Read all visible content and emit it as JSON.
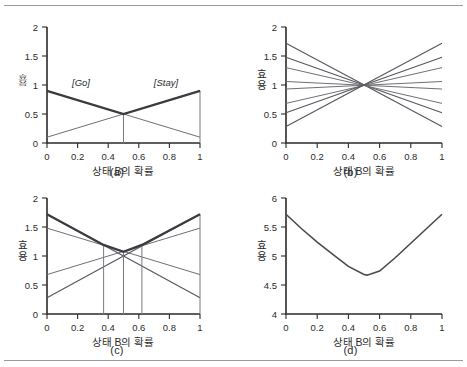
{
  "figure": {
    "panels": [
      {
        "id": "a",
        "caption": "(a)",
        "xlabel": "상태 B의 확률",
        "ylabel": "효용",
        "xticks": [
          "0",
          "0.2",
          "0.4",
          "0.6",
          "0.8",
          "1"
        ],
        "yticks": [
          "0",
          "0.5",
          "1",
          "1.5",
          "2"
        ],
        "annotations": [
          "[Go]",
          "[Stay]"
        ]
      },
      {
        "id": "b",
        "caption": "(b)",
        "xlabel": "상태 B의 확률",
        "ylabel": "효용",
        "xticks": [
          "0",
          "0.2",
          "0.4",
          "0.6",
          "0.8",
          "1"
        ],
        "yticks": [
          "0",
          "0.5",
          "1",
          "1.5",
          "2"
        ],
        "annotations": []
      },
      {
        "id": "c",
        "caption": "(c)",
        "xlabel": "상태 B의 확률",
        "ylabel": "효용",
        "xticks": [
          "0",
          "0.2",
          "0.4",
          "0.6",
          "0.8",
          "1"
        ],
        "yticks": [
          "0",
          "0.5",
          "1",
          "1.5",
          "2"
        ],
        "annotations": []
      },
      {
        "id": "d",
        "caption": "(d)",
        "xlabel": "상태 B의 확률",
        "ylabel": "효용",
        "xticks": [
          "0",
          "0.2",
          "0.4",
          "0.6",
          "0.8",
          "1"
        ],
        "yticks": [
          "4",
          "4.5",
          "5",
          "5.5",
          "6"
        ],
        "annotations": []
      }
    ]
  },
  "chart_data": [
    {
      "type": "line",
      "panel": "a",
      "title": "",
      "xlabel": "상태 B의 확률",
      "ylabel": "효용",
      "xlim": [
        0,
        1
      ],
      "ylim": [
        0,
        2
      ],
      "xticks": [
        0,
        0.2,
        0.4,
        0.6,
        0.8,
        1
      ],
      "yticks": [
        0,
        0.5,
        1,
        1.5,
        2
      ],
      "grid": false,
      "legend": "none",
      "x": [
        0,
        1
      ],
      "series": [
        {
          "name": "Go",
          "values": [
            0.9,
            0.1
          ],
          "style": "thin"
        },
        {
          "name": "Stay",
          "values": [
            0.1,
            0.9
          ],
          "style": "thin"
        }
      ],
      "envelope": {
        "name": "upper envelope",
        "x": [
          0,
          0.5,
          1
        ],
        "values": [
          0.9,
          0.5,
          0.9
        ]
      },
      "crossing": {
        "x": 0.5,
        "y": 0.5
      },
      "vlines": [
        0.5
      ],
      "annotations": [
        {
          "text": "[Go]",
          "x": 0.22,
          "y": 1.0
        },
        {
          "text": "[Stay]",
          "x": 0.74,
          "y": 1.0
        }
      ]
    },
    {
      "type": "line",
      "panel": "b",
      "title": "",
      "xlabel": "상태 B의 확률",
      "ylabel": "효용",
      "xlim": [
        0,
        1
      ],
      "ylim": [
        0,
        2
      ],
      "xticks": [
        0,
        0.2,
        0.4,
        0.6,
        0.8,
        1
      ],
      "yticks": [
        0,
        0.5,
        1,
        1.5,
        2
      ],
      "grid": false,
      "legend": "none",
      "x": [
        0,
        1
      ],
      "series": [
        {
          "name": "line-1",
          "values": [
            1.72,
            0.28
          ],
          "style": "mid"
        },
        {
          "name": "line-2",
          "values": [
            1.48,
            0.52
          ],
          "style": "mid"
        },
        {
          "name": "line-3",
          "values": [
            1.3,
            0.68
          ],
          "style": "thin"
        },
        {
          "name": "line-4",
          "values": [
            1.06,
            0.93
          ],
          "style": "thin"
        },
        {
          "name": "line-5",
          "values": [
            0.93,
            1.06
          ],
          "style": "thin"
        },
        {
          "name": "line-6",
          "values": [
            0.68,
            1.3
          ],
          "style": "thin"
        },
        {
          "name": "line-7",
          "values": [
            0.52,
            1.48
          ],
          "style": "mid"
        },
        {
          "name": "line-8",
          "values": [
            0.28,
            1.72
          ],
          "style": "mid"
        }
      ],
      "crossing": {
        "x": 0.5,
        "y": 1.0
      }
    },
    {
      "type": "line",
      "panel": "c",
      "title": "",
      "xlabel": "상태 B의 확률",
      "ylabel": "효용",
      "xlim": [
        0,
        1
      ],
      "ylim": [
        0,
        2
      ],
      "xticks": [
        0,
        0.2,
        0.4,
        0.6,
        0.8,
        1
      ],
      "yticks": [
        0,
        0.5,
        1,
        1.5,
        2
      ],
      "grid": false,
      "legend": "none",
      "x": [
        0,
        1
      ],
      "series": [
        {
          "name": "line-1",
          "values": [
            1.72,
            0.28
          ],
          "style": "mid"
        },
        {
          "name": "line-2",
          "values": [
            1.48,
            0.68
          ],
          "style": "thin"
        },
        {
          "name": "line-3",
          "values": [
            0.68,
            1.48
          ],
          "style": "thin"
        },
        {
          "name": "line-4",
          "values": [
            0.28,
            1.72
          ],
          "style": "mid"
        }
      ],
      "envelope": {
        "name": "upper envelope",
        "x": [
          0,
          0.37,
          0.5,
          0.62,
          1
        ],
        "values": [
          1.72,
          1.19,
          1.07,
          1.19,
          1.72
        ]
      },
      "vlines": [
        0.37,
        0.5,
        0.62
      ]
    },
    {
      "type": "line",
      "panel": "d",
      "title": "",
      "xlabel": "상태 B의 확률",
      "ylabel": "효용",
      "xlim": [
        0,
        1
      ],
      "ylim": [
        4,
        6
      ],
      "xticks": [
        0,
        0.2,
        0.4,
        0.6,
        0.8,
        1
      ],
      "yticks": [
        4,
        4.5,
        5,
        5.5,
        6
      ],
      "grid": false,
      "legend": "none",
      "x": [
        0,
        0.1,
        0.2,
        0.3,
        0.4,
        0.5,
        0.52,
        0.6,
        0.7,
        0.8,
        0.9,
        1
      ],
      "series": [
        {
          "name": "expected utility",
          "values": [
            5.72,
            5.47,
            5.24,
            5.03,
            4.82,
            4.68,
            4.67,
            4.74,
            4.97,
            5.22,
            5.47,
            5.72
          ],
          "style": "curve"
        }
      ],
      "minimum": {
        "x": 0.52,
        "y": 4.67
      }
    }
  ]
}
